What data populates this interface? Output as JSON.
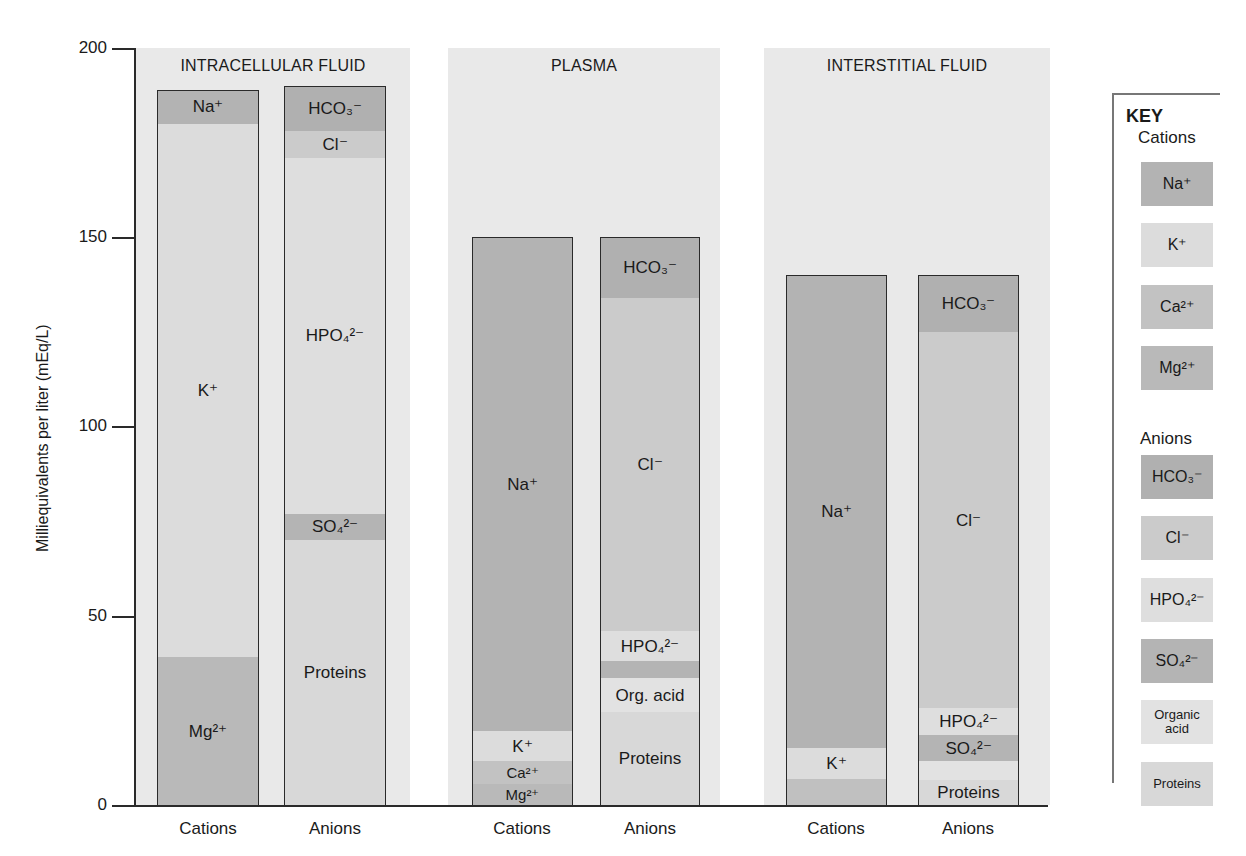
{
  "chart_data": {
    "type": "bar",
    "subtype": "stacked",
    "title": "",
    "ylabel": "Milliequivalents per liter (mEq/L)",
    "xlabel": "",
    "ylim": [
      0,
      200
    ],
    "yticks": [
      0,
      50,
      100,
      150,
      200
    ],
    "grid": false,
    "legend_position": "right",
    "groups": [
      {
        "name": "INTRACELLULAR FLUID",
        "bars": [
          {
            "name": "Cations",
            "total": 189,
            "segments": [
              {
                "ion": "Mg2+",
                "label": "Mg²⁺",
                "value": 39
              },
              {
                "ion": "K+",
                "label": "K⁺",
                "value": 141
              },
              {
                "ion": "Na+",
                "label": "Na⁺",
                "value": 9
              }
            ]
          },
          {
            "name": "Anions",
            "total": 190,
            "segments": [
              {
                "ion": "Proteins",
                "label": "Proteins",
                "value": 70
              },
              {
                "ion": "SO4 2-",
                "label": "SO₄²⁻",
                "value": 7
              },
              {
                "ion": "HPO4 2-",
                "label": "HPO₄²⁻",
                "value": 94
              },
              {
                "ion": "Cl-",
                "label": "Cl⁻",
                "value": 7
              },
              {
                "ion": "HCO3-",
                "label": "HCO₃⁻",
                "value": 12
              }
            ]
          }
        ]
      },
      {
        "name": "PLASMA",
        "bars": [
          {
            "name": "Cations",
            "total": 150,
            "segments": [
              {
                "ion": "Mg2+",
                "label": "Mg²⁺",
                "value": 5.5
              },
              {
                "ion": "Ca2+",
                "label": "Ca²⁺",
                "value": 6
              },
              {
                "ion": "K+",
                "label": "K⁺",
                "value": 8
              },
              {
                "ion": "Na+",
                "label": "Na⁺",
                "value": 130.5
              }
            ]
          },
          {
            "name": "Anions",
            "total": 150,
            "segments": [
              {
                "ion": "Proteins",
                "label": "Proteins",
                "value": 24.5
              },
              {
                "ion": "Organic acid",
                "label": "Org. acid",
                "value": 9
              },
              {
                "ion": "SO4 2-",
                "label": "",
                "value": 4.5
              },
              {
                "ion": "HPO4 2-",
                "label": "HPO₄²⁻",
                "value": 8
              },
              {
                "ion": "Cl-",
                "label": "Cl⁻",
                "value": 88
              },
              {
                "ion": "HCO3-",
                "label": "HCO₃⁻",
                "value": 16
              }
            ]
          }
        ]
      },
      {
        "name": "INTERSTITIAL FLUID",
        "bars": [
          {
            "name": "Cations",
            "total": 140,
            "segments": [
              {
                "ion": "Ca2+/Mg2+",
                "label": "",
                "value": 7
              },
              {
                "ion": "K+",
                "label": "K⁺",
                "value": 8
              },
              {
                "ion": "Na+",
                "label": "Na⁺",
                "value": 125
              }
            ]
          },
          {
            "name": "Anions",
            "total": 140,
            "segments": [
              {
                "ion": "Proteins",
                "label": "Proteins",
                "value": 6.5
              },
              {
                "ion": "Organic acid",
                "label": "",
                "value": 5
              },
              {
                "ion": "SO4 2-",
                "label": "SO₄²⁻",
                "value": 7
              },
              {
                "ion": "HPO4 2-",
                "label": "HPO₄²⁻",
                "value": 7
              },
              {
                "ion": "Cl-",
                "label": "Cl⁻",
                "value": 99.5
              },
              {
                "ion": "HCO3-",
                "label": "HCO₃⁻",
                "value": 15
              }
            ]
          }
        ]
      }
    ],
    "legend": {
      "title": "KEY",
      "cations": [
        "Na⁺",
        "K⁺",
        "Ca²⁺",
        "Mg²⁺"
      ],
      "anions": [
        "HCO₃⁻",
        "Cl⁻",
        "HPO₄²⁻",
        "SO₄²⁻",
        "Organic acid",
        "Proteins"
      ]
    }
  },
  "colors": {
    "Na+": "#b3b3b3",
    "K+": "#dcdcdc",
    "Ca2+": "#c2c2c2",
    "Mg2+": "#b9b9b9",
    "Ca2+/Mg2+": "#c0c0c0",
    "HCO3-": "#b0b0b0",
    "Cl-": "#cbcbcb",
    "HPO4 2-": "#dedede",
    "SO4 2-": "#b4b4b4",
    "Organic acid": "#e2e2e2",
    "Proteins": "#d8d8d8",
    "section_bg": "#e9e9e9"
  },
  "axis": {
    "ylabel": "Milliequivalents per liter (mEq/L)",
    "ticks": [
      "200",
      "150",
      "100",
      "50",
      "0"
    ]
  },
  "sections": {
    "ic_title": "INTRACELLULAR FLUID",
    "pl_title": "PLASMA",
    "is_title": "INTERSTITIAL FLUID"
  },
  "xlabels": [
    "Cations",
    "Anions",
    "Cations",
    "Anions",
    "Cations",
    "Anions"
  ],
  "key": {
    "title": "KEY",
    "cations_heading": "Cations",
    "anions_heading": "Anions",
    "cations": [
      "Na⁺",
      "K⁺",
      "Ca²⁺",
      "Mg²⁺"
    ],
    "anions": [
      "HCO₃⁻",
      "Cl⁻",
      "HPO₄²⁻",
      "SO₄²⁻",
      "Organic acid",
      "Proteins"
    ]
  }
}
